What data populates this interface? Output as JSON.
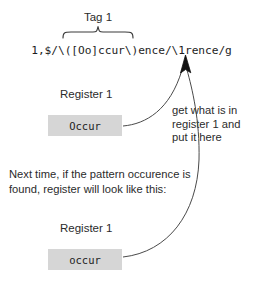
{
  "diagram": {
    "tag": {
      "label": "Tag 1",
      "brace_name": "curly-brace-over-capture-group"
    },
    "command": {
      "text": "1,$/\\([Oo]ccur\\)ence/\\1rence/g"
    },
    "registers": [
      {
        "label": "Register 1",
        "value": "Occur",
        "position": "top"
      },
      {
        "label": "Register 1",
        "value": "occur",
        "position": "bottom"
      }
    ],
    "annotation": {
      "line1": "get what is in",
      "line2": "register 1 and",
      "line3": "put it here"
    },
    "explanation": {
      "line1": "Next time, if the pattern occurence is",
      "line2": "found, register will look like this:"
    },
    "colors": {
      "register_fill": "#d6d6d6",
      "text": "#2b2b2b",
      "stroke": "#3a3a3a",
      "background": "#ffffff"
    },
    "arrows": [
      {
        "name": "arrow-from-top-register-to-backreference"
      },
      {
        "name": "arrow-from-bottom-register-to-backreference"
      }
    ]
  }
}
